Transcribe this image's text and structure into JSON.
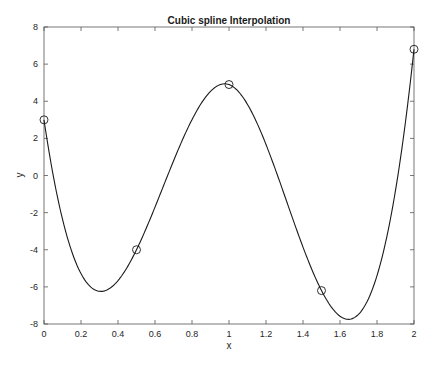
{
  "chart_data": {
    "type": "line",
    "title": "Cubic spline Interpolation",
    "xlabel": "x",
    "ylabel": "y",
    "xlim": [
      0,
      2
    ],
    "ylim": [
      -8,
      8
    ],
    "xticks": [
      0,
      0.2,
      0.4,
      0.6,
      0.8,
      1,
      1.2,
      1.4,
      1.6,
      1.8,
      2
    ],
    "xtick_labels": [
      "0",
      "0.2",
      "0.4",
      "0.6",
      "0.8",
      "1",
      "1.2",
      "1.4",
      "1.6",
      "1.8",
      "2"
    ],
    "yticks": [
      -8,
      -6,
      -4,
      -2,
      0,
      2,
      4,
      6,
      8
    ],
    "ytick_labels": [
      "-8",
      "-6",
      "-4",
      "-2",
      "0",
      "2",
      "4",
      "6",
      "8"
    ],
    "grid": false,
    "legend": null,
    "series": [
      {
        "name": "data points",
        "style": "markers",
        "marker": "circle-open",
        "x": [
          0,
          0.5,
          1,
          1.5,
          2
        ],
        "y": [
          3,
          -4,
          4.9,
          -6.2,
          6.8
        ]
      },
      {
        "name": "cubic spline",
        "style": "line",
        "interpolation": "cubic-spline-not-a-knot",
        "x_range": [
          0,
          2
        ],
        "local_minima": [
          {
            "x": 0.31,
            "y": -6.3
          },
          {
            "x": 1.65,
            "y": -7.7
          }
        ],
        "local_maxima": [
          {
            "x": 0.98,
            "y": 5.0
          }
        ]
      }
    ],
    "colors": {
      "line": "#1a1a1a",
      "axes": "#555555",
      "marker": "#1a1a1a"
    }
  }
}
